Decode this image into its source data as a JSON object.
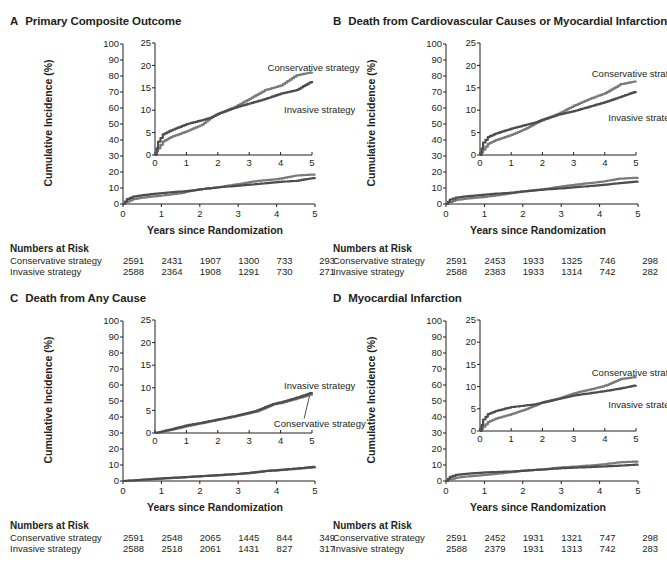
{
  "colors": {
    "invasive": "#4d4d4d",
    "conservative": "#7a7a7a",
    "axis": "#231f20"
  },
  "common": {
    "y_axis_title": "Cumulative Incidence (%)",
    "x_axis_title": "Years since Randomization",
    "risk_header": "Numbers at Risk",
    "series_labels": {
      "conservative": "Conservative strategy",
      "invasive": "Invasive strategy"
    }
  },
  "panels": [
    {
      "letter": "A",
      "title": "Primary Composite Outcome"
    },
    {
      "letter": "B",
      "title": "Death from Cardiovascular Causes or Myocardial Infarction"
    },
    {
      "letter": "C",
      "title": "Death from Any Cause"
    },
    {
      "letter": "D",
      "title": "Myocardial Infarction"
    }
  ],
  "chart_data": [
    {
      "type": "line",
      "title": "A Primary Composite Outcome",
      "xlabel": "Years since Randomization",
      "ylabel": "Cumulative Incidence (%)",
      "x_ticks": [
        0,
        1,
        2,
        3,
        4,
        5
      ],
      "y_ticks": [
        0,
        10,
        20,
        30,
        40,
        50,
        60,
        70,
        80,
        90,
        100
      ],
      "ylim": [
        0,
        100
      ],
      "inset": {
        "ylim": [
          0,
          25
        ],
        "y_ticks": [
          0,
          5,
          10,
          15,
          20,
          25
        ],
        "x_ticks": [
          0,
          1,
          2,
          3,
          4,
          5
        ]
      },
      "x": [
        0,
        0.1,
        0.25,
        0.5,
        1,
        1.5,
        1.75,
        2,
        2.5,
        3,
        3.5,
        4,
        4.5,
        5
      ],
      "series": [
        {
          "name": "Conservative strategy",
          "values": [
            0,
            1.5,
            3,
            4,
            5.3,
            6.8,
            8.2,
            9.2,
            10.6,
            12.5,
            14.5,
            15.5,
            17.8,
            18.5
          ]
        },
        {
          "name": "Invasive strategy",
          "values": [
            0,
            3,
            4.6,
            5.5,
            6.9,
            7.8,
            8.3,
            9.2,
            10.5,
            11.5,
            12.5,
            13.7,
            14.5,
            16.5
          ]
        }
      ],
      "annotations": [
        {
          "text": "Conservative strategy",
          "x": 3.9,
          "y": 19.5
        },
        {
          "text": "Invasive strategy",
          "x": 4.1,
          "y": 10
        }
      ],
      "numbers_at_risk": {
        "times": [
          0,
          1,
          2,
          3,
          4,
          5
        ],
        "Conservative strategy": [
          2591,
          2431,
          1907,
          1300,
          733,
          293
        ],
        "Invasive strategy": [
          2588,
          2364,
          1908,
          1291,
          730,
          271
        ]
      }
    },
    {
      "type": "line",
      "title": "B Death from Cardiovascular Causes or Myocardial Infarction",
      "xlabel": "Years since Randomization",
      "ylabel": "Cumulative Incidence (%)",
      "x_ticks": [
        0,
        1,
        2,
        3,
        4,
        5
      ],
      "y_ticks": [
        0,
        10,
        20,
        30,
        40,
        50,
        60,
        70,
        80,
        90,
        100
      ],
      "ylim": [
        0,
        100
      ],
      "inset": {
        "ylim": [
          0,
          25
        ],
        "y_ticks": [
          0,
          5,
          10,
          15,
          20,
          25
        ],
        "x_ticks": [
          0,
          1,
          2,
          3,
          4,
          5
        ]
      },
      "x": [
        0,
        0.1,
        0.25,
        0.5,
        1,
        1.5,
        1.75,
        2,
        2.5,
        3,
        3.5,
        4,
        4.5,
        5
      ],
      "series": [
        {
          "name": "Conservative strategy",
          "values": [
            0,
            1.2,
            2.5,
            3.3,
            4.5,
            6,
            7,
            7.8,
            9.2,
            11,
            12.5,
            13.8,
            15.8,
            16.5
          ]
        },
        {
          "name": "Invasive strategy",
          "values": [
            0,
            2.8,
            4,
            4.8,
            5.9,
            6.8,
            7.2,
            7.9,
            9,
            9.8,
            10.8,
            11.8,
            13,
            14.2
          ]
        }
      ],
      "annotations": [
        {
          "text": "Conservative strategy",
          "x": 3.9,
          "y": 18
        },
        {
          "text": "Invasive strategy",
          "x": 4.1,
          "y": 8.3
        }
      ],
      "numbers_at_risk": {
        "times": [
          0,
          1,
          2,
          3,
          4,
          5
        ],
        "Conservative strategy": [
          2591,
          2453,
          1933,
          1325,
          746,
          298
        ],
        "Invasive strategy": [
          2588,
          2383,
          1933,
          1314,
          742,
          282
        ]
      }
    },
    {
      "type": "line",
      "title": "C Death from Any Cause",
      "xlabel": "Years since Randomization",
      "ylabel": "Cumulative Incidence (%)",
      "x_ticks": [
        0,
        1,
        2,
        3,
        4,
        5
      ],
      "y_ticks": [
        0,
        10,
        20,
        30,
        40,
        50,
        60,
        70,
        80,
        90,
        100
      ],
      "ylim": [
        0,
        100
      ],
      "inset": {
        "ylim": [
          0,
          25
        ],
        "y_ticks": [
          0,
          5,
          10,
          15,
          20,
          25
        ],
        "x_ticks": [
          0,
          1,
          2,
          3,
          4,
          5
        ]
      },
      "x": [
        0,
        0.5,
        1,
        1.5,
        2,
        2.5,
        3,
        3.25,
        3.5,
        3.75,
        4,
        4.5,
        4.8,
        5
      ],
      "series": [
        {
          "name": "Conservative strategy",
          "values": [
            0,
            0.7,
            1.5,
            2.2,
            2.9,
            3.6,
            4.4,
            4.8,
            5.5,
            6.3,
            6.6,
            7.6,
            8.2,
            8.6
          ]
        },
        {
          "name": "Invasive strategy",
          "values": [
            0,
            0.8,
            1.7,
            2.3,
            3,
            3.7,
            4.5,
            5,
            5.7,
            6.4,
            6.8,
            7.8,
            8.5,
            9
          ]
        }
      ],
      "annotations": [
        {
          "text": "Invasive strategy",
          "x": 4.1,
          "y": 10.5
        },
        {
          "text": "Conservative strategy",
          "x": 4.1,
          "y": 2
        }
      ],
      "numbers_at_risk": {
        "times": [
          0,
          1,
          2,
          3,
          4,
          5
        ],
        "Conservative strategy": [
          2591,
          2548,
          2065,
          1445,
          844,
          349
        ],
        "Invasive strategy": [
          2588,
          2518,
          2061,
          1431,
          827,
          317
        ]
      }
    },
    {
      "type": "line",
      "title": "D Myocardial Infarction",
      "xlabel": "Years since Randomization",
      "ylabel": "Cumulative Incidence (%)",
      "x_ticks": [
        0,
        1,
        2,
        3,
        4,
        5
      ],
      "y_ticks": [
        0,
        10,
        20,
        30,
        40,
        50,
        60,
        70,
        80,
        90,
        100
      ],
      "ylim": [
        0,
        100
      ],
      "inset": {
        "ylim": [
          0,
          25
        ],
        "y_ticks": [
          0,
          5,
          10,
          15,
          20,
          25
        ],
        "x_ticks": [
          0,
          1,
          2,
          3,
          4,
          5
        ]
      },
      "x": [
        0,
        0.1,
        0.25,
        0.5,
        1,
        1.5,
        1.75,
        2,
        2.5,
        3,
        3.5,
        4,
        4.5,
        5
      ],
      "series": [
        {
          "name": "Conservative strategy",
          "values": [
            0,
            1,
            2,
            2.8,
            3.8,
            5,
            5.7,
            6.5,
            7.3,
            8.5,
            9.3,
            10.2,
            11.7,
            12.2
          ]
        },
        {
          "name": "Invasive strategy",
          "values": [
            0,
            2.6,
            3.8,
            4.5,
            5.4,
            5.8,
            6,
            6.4,
            7.2,
            8,
            8.5,
            9,
            9.6,
            10.3
          ]
        }
      ],
      "annotations": [
        {
          "text": "Conservative strategy",
          "x": 3.9,
          "y": 13
        },
        {
          "text": "Invasive strategy",
          "x": 4.1,
          "y": 5.8
        }
      ],
      "numbers_at_risk": {
        "times": [
          0,
          1,
          2,
          3,
          4,
          5
        ],
        "Conservative strategy": [
          2591,
          2452,
          1931,
          1321,
          747,
          298
        ],
        "Invasive strategy": [
          2588,
          2379,
          1931,
          1313,
          742,
          283
        ]
      }
    }
  ]
}
